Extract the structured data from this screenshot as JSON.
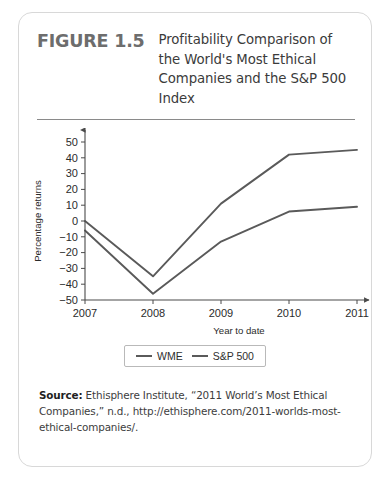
{
  "figure": {
    "number_label": "FIGURE 1.5",
    "title": "Profitability Comparison of the World's Most Ethical Companies and the S&P 500 Index"
  },
  "source": {
    "label": "Source:",
    "text": " Ethisphere Institute, “2011 World’s Most Ethical Companies,” n.d., http://ethisphere.com/2011-worlds-most-ethical-companies/."
  },
  "legend": {
    "items": [
      {
        "label": "WME",
        "color": "#5a5a5a"
      },
      {
        "label": "S&P 500",
        "color": "#5a5a5a"
      }
    ]
  },
  "chart_data": {
    "type": "line",
    "title": "",
    "xlabel": "Year to date",
    "ylabel": "Percentage returns",
    "categories": [
      "2007",
      "2008",
      "2009",
      "2010",
      "2011"
    ],
    "x": [
      2007,
      2008,
      2009,
      2010,
      2011
    ],
    "series": [
      {
        "name": "WME",
        "values": [
          0,
          -35,
          11,
          42,
          45
        ],
        "color": "#5a5a5a"
      },
      {
        "name": "S&P 500",
        "values": [
          -6,
          -46,
          -13,
          6,
          9
        ],
        "color": "#5a5a5a"
      }
    ],
    "ylim": [
      -50,
      50
    ],
    "yticks": [
      50,
      40,
      30,
      20,
      10,
      0,
      -10,
      -20,
      -30,
      -40,
      -50
    ],
    "ytick_labels": [
      "50",
      "40",
      "30",
      "20",
      "10",
      "0",
      "−10",
      "−20",
      "−30",
      "−40",
      "−50"
    ],
    "xticks": [
      2007,
      2008,
      2009,
      2010,
      2011
    ],
    "xtick_labels": [
      "2007",
      "2008",
      "2009",
      "2010",
      "2011"
    ],
    "grid": false,
    "legend_position": "below"
  }
}
